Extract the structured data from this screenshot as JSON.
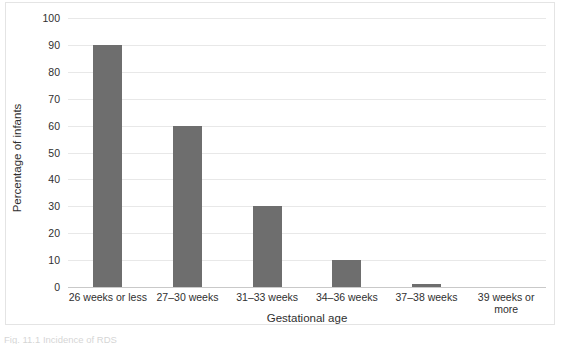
{
  "chart_data": {
    "type": "bar",
    "title": "",
    "xlabel": "Gestational age",
    "ylabel": "Percentage of infants",
    "categories": [
      "26 weeks or less",
      "27–30 weeks",
      "31–33 weeks",
      "34–36 weeks",
      "37–38 weeks",
      "39 weeks or more"
    ],
    "values": [
      90,
      60,
      30,
      10,
      1,
      0
    ],
    "ylim": [
      0,
      100
    ],
    "ytick_labels": [
      "0",
      "10",
      "20",
      "30",
      "40",
      "50",
      "60",
      "70",
      "80",
      "90",
      "100"
    ],
    "ytick_values": [
      0,
      10,
      20,
      30,
      40,
      50,
      60,
      70,
      80,
      90,
      100
    ],
    "grid": true,
    "legend": false,
    "bar_color": "#6e6e6e",
    "gridline_color": "#e8e8e8",
    "axis_color": "#c9c9c9",
    "frame_color": "#e4e4e4",
    "background_color": "#ffffff"
  },
  "caption": "Fig. 11.1 Incidence of RDS"
}
